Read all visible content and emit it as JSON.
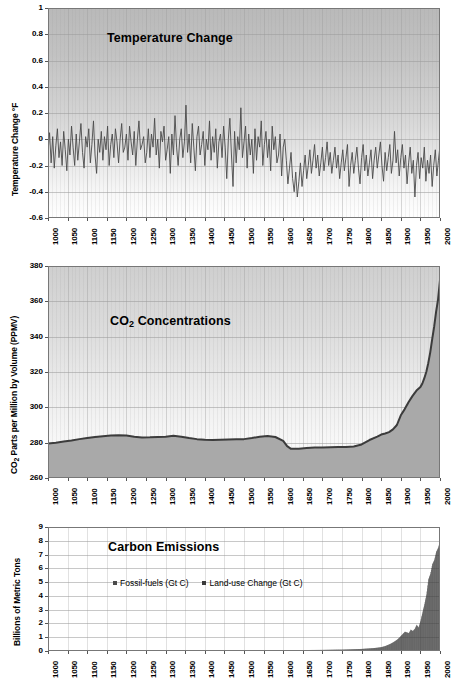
{
  "figure": {
    "background_color": "#ffffff",
    "panel_count": 3
  },
  "chart_data": [
    {
      "type": "line",
      "title": "Temperature Change",
      "xlabel": "",
      "ylabel": "Temperature Change °F",
      "xlim": [
        1000,
        2000
      ],
      "ylim": [
        -0.6,
        1.0
      ],
      "yticks": [
        "1",
        "0.8",
        "0.6",
        "0.4",
        "0.2",
        "0",
        "-0.2",
        "-0.4",
        "-0.6"
      ],
      "ytick_values": [
        1,
        0.8,
        0.6,
        0.4,
        0.2,
        0,
        -0.2,
        -0.4,
        -0.6
      ],
      "xticks": [
        "1000",
        "1050",
        "1100",
        "1150",
        "1200",
        "1250",
        "1300",
        "1350",
        "1400",
        "1450",
        "1500",
        "1550",
        "1600",
        "1650",
        "1700",
        "1750",
        "1800",
        "1850",
        "1900",
        "1950",
        "2000"
      ],
      "xtick_values": [
        1000,
        1050,
        1100,
        1150,
        1200,
        1250,
        1300,
        1350,
        1400,
        1450,
        1500,
        1550,
        1600,
        1650,
        1700,
        1750,
        1800,
        1850,
        1900,
        1950,
        2000
      ],
      "grid": true,
      "legend": null,
      "series": [
        {
          "name": "Temperature Change °F",
          "color": "#4a4a4a",
          "x": [
            1000,
            1004,
            1008,
            1012,
            1016,
            1020,
            1024,
            1028,
            1032,
            1036,
            1040,
            1044,
            1048,
            1052,
            1056,
            1060,
            1064,
            1068,
            1072,
            1076,
            1080,
            1084,
            1088,
            1092,
            1096,
            1100,
            1104,
            1108,
            1112,
            1116,
            1120,
            1124,
            1128,
            1132,
            1136,
            1140,
            1144,
            1148,
            1152,
            1156,
            1160,
            1164,
            1168,
            1172,
            1176,
            1180,
            1184,
            1188,
            1192,
            1196,
            1200,
            1204,
            1208,
            1212,
            1216,
            1220,
            1224,
            1228,
            1232,
            1236,
            1240,
            1244,
            1248,
            1252,
            1256,
            1260,
            1264,
            1268,
            1272,
            1276,
            1280,
            1284,
            1288,
            1292,
            1296,
            1300,
            1304,
            1308,
            1312,
            1316,
            1320,
            1324,
            1328,
            1332,
            1336,
            1340,
            1344,
            1348,
            1352,
            1356,
            1360,
            1364,
            1368,
            1372,
            1376,
            1380,
            1384,
            1388,
            1392,
            1396,
            1400,
            1404,
            1408,
            1412,
            1416,
            1420,
            1424,
            1428,
            1432,
            1436,
            1440,
            1444,
            1448,
            1452,
            1456,
            1460,
            1464,
            1468,
            1472,
            1476,
            1480,
            1484,
            1488,
            1492,
            1496,
            1500,
            1504,
            1508,
            1512,
            1516,
            1520,
            1524,
            1528,
            1532,
            1536,
            1540,
            1544,
            1548,
            1552,
            1556,
            1560,
            1564,
            1568,
            1572,
            1576,
            1580,
            1584,
            1588,
            1592,
            1596,
            1600,
            1604,
            1608,
            1612,
            1616,
            1620,
            1624,
            1628,
            1632,
            1636,
            1640,
            1644,
            1648,
            1652,
            1656,
            1660,
            1664,
            1668,
            1672,
            1676,
            1680,
            1684,
            1688,
            1692,
            1696,
            1700,
            1704,
            1708,
            1712,
            1716,
            1720,
            1724,
            1728,
            1732,
            1736,
            1740,
            1744,
            1748,
            1752,
            1756,
            1760,
            1764,
            1768,
            1772,
            1776,
            1780,
            1784,
            1788,
            1792,
            1796,
            1800,
            1804,
            1808,
            1812,
            1816,
            1820,
            1824,
            1828,
            1832,
            1836,
            1840,
            1844,
            1848,
            1852,
            1856,
            1860,
            1864,
            1868,
            1872,
            1876,
            1880,
            1884,
            1888,
            1892,
            1896,
            1900,
            1904,
            1908,
            1912,
            1916,
            1920,
            1924,
            1928,
            1932,
            1936,
            1940,
            1944,
            1948,
            1952,
            1956,
            1960,
            1964,
            1968,
            1972,
            1976,
            1980,
            1984,
            1988,
            1992,
            1996,
            2000
          ],
          "y": [
            -0.1,
            0.05,
            -0.18,
            0.02,
            -0.22,
            -0.05,
            0.08,
            -0.14,
            -0.02,
            -0.2,
            0.06,
            -0.08,
            -0.24,
            0.0,
            -0.12,
            0.1,
            -0.06,
            -0.2,
            0.04,
            -0.16,
            -0.02,
            0.12,
            -0.1,
            -0.22,
            0.02,
            -0.06,
            0.08,
            -0.18,
            -0.04,
            0.14,
            -0.12,
            -0.26,
            0.0,
            -0.1,
            0.06,
            -0.16,
            0.02,
            -0.08,
            0.1,
            -0.2,
            -0.04,
            0.04,
            -0.14,
            0.08,
            -0.02,
            -0.18,
            0.0,
            0.12,
            -0.1,
            -0.06,
            0.04,
            -0.16,
            0.1,
            -0.02,
            -0.12,
            0.06,
            -0.2,
            0.0,
            0.14,
            -0.08,
            -0.04,
            0.02,
            -0.18,
            -0.1,
            0.08,
            -0.14,
            0.04,
            -0.06,
            0.16,
            -0.12,
            0.0,
            -0.22,
            0.06,
            -0.02,
            0.1,
            -0.16,
            -0.08,
            0.02,
            -0.26,
            0.04,
            -0.12,
            0.18,
            -0.06,
            -0.2,
            0.0,
            0.08,
            -0.14,
            -0.02,
            0.26,
            -0.1,
            0.04,
            -0.18,
            0.12,
            -0.06,
            -0.24,
            0.02,
            0.1,
            -0.12,
            -0.04,
            0.06,
            -0.2,
            0.0,
            -0.08,
            0.14,
            -0.16,
            0.02,
            -0.1,
            0.08,
            -0.22,
            -0.02,
            0.04,
            -0.14,
            0.1,
            -0.06,
            -0.3,
            0.0,
            0.16,
            -0.12,
            -0.36,
            0.06,
            -0.18,
            0.02,
            -0.08,
            0.24,
            -0.14,
            -0.02,
            0.1,
            -0.22,
            0.04,
            -0.12,
            0.0,
            -0.26,
            0.08,
            -0.16,
            0.02,
            -0.06,
            0.14,
            -0.2,
            -0.04,
            0.06,
            -0.14,
            0.0,
            -0.24,
            0.1,
            -0.08,
            0.02,
            -0.18,
            -0.12,
            0.04,
            -0.28,
            -0.06,
            0.0,
            -0.16,
            -0.34,
            -0.22,
            -0.1,
            -0.3,
            -0.4,
            -0.25,
            -0.44,
            -0.32,
            -0.18,
            -0.36,
            -0.24,
            -0.12,
            -0.3,
            -0.2,
            -0.08,
            -0.26,
            -0.16,
            -0.04,
            -0.22,
            -0.12,
            -0.28,
            -0.18,
            -0.06,
            -0.24,
            -0.14,
            -0.02,
            -0.2,
            -0.1,
            -0.26,
            -0.16,
            -0.06,
            -0.22,
            -0.12,
            -0.3,
            -0.18,
            -0.08,
            -0.24,
            -0.14,
            -0.04,
            -0.36,
            -0.2,
            -0.1,
            -0.26,
            -0.16,
            -0.06,
            -0.22,
            -0.34,
            -0.14,
            -0.04,
            -0.24,
            -0.12,
            -0.28,
            -0.18,
            -0.08,
            -0.3,
            -0.16,
            -0.06,
            -0.22,
            -0.12,
            -0.02,
            -0.2,
            -0.32,
            -0.1,
            -0.24,
            -0.14,
            -0.04,
            -0.26,
            -0.16,
            0.06,
            -0.18,
            -0.08,
            -0.28,
            -0.14,
            -0.04,
            -0.22,
            -0.12,
            -0.34,
            -0.18,
            -0.06,
            -0.26,
            -0.16,
            -0.44,
            -0.2,
            -0.1,
            -0.3,
            -0.14,
            -0.22,
            -0.06,
            -0.32,
            -0.16,
            -0.26,
            -0.12,
            -0.36,
            -0.2,
            -0.08,
            -0.28,
            -0.16,
            -0.05,
            -0.24,
            -0.12,
            -0.38,
            -0.18,
            0.0,
            -0.3,
            -0.1,
            0.06,
            -0.2,
            -0.02,
            0.14,
            -0.08,
            0.2,
            0.04,
            0.26,
            0.1,
            0.32,
            0.16,
            0.02,
            0.22,
            -0.04,
            0.18,
            0.08,
            0.28,
            0.12,
            -0.02,
            0.24,
            0.14,
            0.34,
            0.2,
            0.4,
            0.28,
            0.46,
            0.36,
            0.52,
            0.65
          ]
        }
      ]
    },
    {
      "type": "area",
      "title": "CO2 Concentrations",
      "title_main": "CO",
      "title_sub": "2",
      "title_rest": " Concentrations",
      "xlabel": "",
      "ylabel": "CO2 Parts per Million by Volume (PPMV)",
      "ylabel_main": "CO",
      "ylabel_sub": "2",
      "ylabel_rest": " Parts per Million by Volume (PPMV)",
      "xlim": [
        1000,
        2000
      ],
      "ylim": [
        260,
        380
      ],
      "yticks": [
        "380",
        "360",
        "340",
        "320",
        "300",
        "280",
        "260"
      ],
      "ytick_values": [
        380,
        360,
        340,
        320,
        300,
        280,
        260
      ],
      "xticks": [
        "1000",
        "1050",
        "1100",
        "1150",
        "1200",
        "1250",
        "1300",
        "1350",
        "1400",
        "1450",
        "1500",
        "1550",
        "1600",
        "1650",
        "1700",
        "1750",
        "1800",
        "1850",
        "1900",
        "1950",
        "2000"
      ],
      "xtick_values": [
        1000,
        1050,
        1100,
        1150,
        1200,
        1250,
        1300,
        1350,
        1400,
        1450,
        1500,
        1550,
        1600,
        1650,
        1700,
        1750,
        1800,
        1850,
        1900,
        1950,
        2000
      ],
      "grid": true,
      "legend": null,
      "series": [
        {
          "name": "CO2 Concentration (PPMV)",
          "line_color": "#3c3c3c",
          "fill_color": "#a9a9a9",
          "x": [
            1000,
            1020,
            1040,
            1060,
            1080,
            1100,
            1120,
            1140,
            1160,
            1180,
            1200,
            1220,
            1240,
            1260,
            1280,
            1300,
            1320,
            1340,
            1360,
            1380,
            1400,
            1420,
            1440,
            1460,
            1480,
            1500,
            1520,
            1540,
            1560,
            1580,
            1600,
            1610,
            1620,
            1640,
            1660,
            1680,
            1700,
            1720,
            1740,
            1760,
            1780,
            1800,
            1820,
            1840,
            1850,
            1860,
            1870,
            1880,
            1890,
            1900,
            1910,
            1920,
            1930,
            1940,
            1950,
            1955,
            1960,
            1965,
            1970,
            1975,
            1980,
            1985,
            1990,
            1995,
            2000
          ],
          "y": [
            279.5,
            280.0,
            280.6,
            281.2,
            282.0,
            282.6,
            283.2,
            283.6,
            284.0,
            284.2,
            284.1,
            283.4,
            282.9,
            283.0,
            283.2,
            283.4,
            283.9,
            283.4,
            282.6,
            282.0,
            281.6,
            281.5,
            281.6,
            281.8,
            282.0,
            282.0,
            282.6,
            283.4,
            283.8,
            283.2,
            281.0,
            278.0,
            276.5,
            276.6,
            277.0,
            277.2,
            277.3,
            277.4,
            277.6,
            277.5,
            277.8,
            279.0,
            281.5,
            283.4,
            284.6,
            285.2,
            286.0,
            287.5,
            290.0,
            295.5,
            299.0,
            303.0,
            306.5,
            309.5,
            311.5,
            313.5,
            316.5,
            320.0,
            325.0,
            331.0,
            338.5,
            345.5,
            354.0,
            361.0,
            372.0
          ]
        }
      ]
    },
    {
      "type": "bar",
      "title": "Carbon Emissions",
      "xlabel": "",
      "ylabel": "Billions of Metric Tons",
      "xlim": [
        1000,
        2000
      ],
      "ylim": [
        0,
        9
      ],
      "yticks": [
        "9",
        "8",
        "7",
        "6",
        "5",
        "4",
        "3",
        "2",
        "1",
        "0"
      ],
      "ytick_values": [
        9,
        8,
        7,
        6,
        5,
        4,
        3,
        2,
        1,
        0
      ],
      "xticks": [
        "1000",
        "1050",
        "1100",
        "1150",
        "1200",
        "1250",
        "1300",
        "1350",
        "1400",
        "1450",
        "1500",
        "1550",
        "1600",
        "1650",
        "1700",
        "1750",
        "1800",
        "1850",
        "1900",
        "1950",
        "2000"
      ],
      "xtick_values": [
        1000,
        1050,
        1100,
        1150,
        1200,
        1250,
        1300,
        1350,
        1400,
        1450,
        1500,
        1550,
        1600,
        1650,
        1700,
        1750,
        1800,
        1850,
        1900,
        1950,
        2000
      ],
      "grid": true,
      "legend": {
        "position": "inside-left",
        "entries": [
          {
            "label": "Fossil-fuels (Gt C)",
            "color": "#4b4b4b"
          },
          {
            "label": "Land-use Change (Gt C)",
            "color": "#3a3a3a"
          }
        ]
      },
      "series": [
        {
          "name": "Total carbon emissions (Gt C)",
          "color": "#3d3d3d",
          "x": [
            1000,
            1050,
            1100,
            1150,
            1200,
            1250,
            1300,
            1350,
            1400,
            1450,
            1500,
            1550,
            1600,
            1650,
            1700,
            1720,
            1740,
            1750,
            1760,
            1770,
            1780,
            1790,
            1800,
            1810,
            1820,
            1830,
            1840,
            1850,
            1855,
            1860,
            1865,
            1870,
            1875,
            1880,
            1885,
            1890,
            1895,
            1900,
            1905,
            1910,
            1915,
            1920,
            1925,
            1930,
            1935,
            1940,
            1945,
            1950,
            1955,
            1960,
            1965,
            1970,
            1975,
            1980,
            1985,
            1990,
            1995,
            2000
          ],
          "y": [
            0.02,
            0.02,
            0.02,
            0.03,
            0.03,
            0.03,
            0.04,
            0.04,
            0.04,
            0.05,
            0.05,
            0.06,
            0.06,
            0.07,
            0.08,
            0.09,
            0.1,
            0.1,
            0.11,
            0.12,
            0.13,
            0.14,
            0.15,
            0.17,
            0.19,
            0.21,
            0.24,
            0.28,
            0.32,
            0.36,
            0.42,
            0.48,
            0.55,
            0.63,
            0.72,
            0.82,
            0.95,
            1.1,
            1.25,
            1.4,
            1.35,
            1.3,
            1.55,
            1.45,
            1.6,
            1.9,
            1.7,
            2.2,
            2.8,
            3.4,
            4.1,
            5.2,
            5.6,
            6.3,
            6.6,
            7.2,
            7.5,
            8.0
          ]
        }
      ]
    }
  ]
}
